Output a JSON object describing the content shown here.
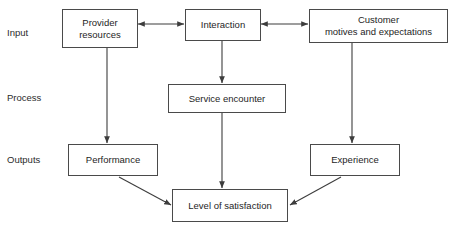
{
  "diagram": {
    "background_color": "#ffffff",
    "line_color": "#4a4a4a",
    "text_color": "#1e1e1e",
    "row_labels": [
      {
        "id": "input",
        "label": "Input"
      },
      {
        "id": "process",
        "label": "Process"
      },
      {
        "id": "outputs",
        "label": "Outputs"
      }
    ],
    "nodes": [
      {
        "id": "provider-resources",
        "label": "Provider\nresources"
      },
      {
        "id": "interaction",
        "label": "Interaction"
      },
      {
        "id": "customer-motives",
        "label": "Customer\nmotives and expectations"
      },
      {
        "id": "service-encounter",
        "label": "Service encounter"
      },
      {
        "id": "performance",
        "label": "Performance"
      },
      {
        "id": "experience",
        "label": "Experience"
      },
      {
        "id": "level-of-satisfaction",
        "label": "Level of satisfaction"
      }
    ],
    "edges": [
      {
        "id": "provider-interaction",
        "from": "provider-resources",
        "to": "interaction",
        "direction": "bidirectional"
      },
      {
        "id": "interaction-customer",
        "from": "interaction",
        "to": "customer-motives",
        "direction": "bidirectional"
      },
      {
        "id": "provider-performance",
        "from": "provider-resources",
        "to": "performance",
        "direction": "forward"
      },
      {
        "id": "interaction-service-encounter",
        "from": "interaction",
        "to": "service-encounter",
        "direction": "forward"
      },
      {
        "id": "customer-experience",
        "from": "customer-motives",
        "to": "experience",
        "direction": "forward"
      },
      {
        "id": "service-encounter-satisfaction",
        "from": "service-encounter",
        "to": "level-of-satisfaction",
        "direction": "forward"
      },
      {
        "id": "performance-satisfaction",
        "from": "performance",
        "to": "level-of-satisfaction",
        "direction": "forward"
      },
      {
        "id": "experience-satisfaction",
        "from": "experience",
        "to": "level-of-satisfaction",
        "direction": "forward"
      }
    ]
  }
}
